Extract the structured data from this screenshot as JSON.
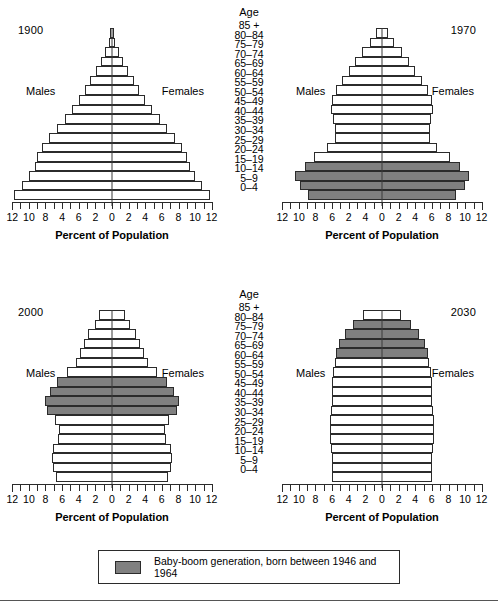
{
  "age_column": {
    "heading": "Age",
    "groups": [
      "85 +",
      "80–84",
      "75–79",
      "70–74",
      "65–69",
      "60–64",
      "55–59",
      "50–54",
      "45–49",
      "40–44",
      "35–39",
      "30–34",
      "25–29",
      "20–24",
      "15–19",
      "10–14",
      "5–9",
      "0–4"
    ]
  },
  "legend": {
    "label": "Baby-boom generation, born between 1946 and 1964",
    "swatch_color": "#808080"
  },
  "common": {
    "males_label": "Males",
    "females_label": "Females",
    "x_title": "Percent of Population",
    "bar_fill": "#ffffff",
    "bar_stroke": "#2b2b2b",
    "shaded_fill": "#808080"
  },
  "chart_data": {
    "type": "bar",
    "xlabel": "Percent of Population",
    "ylabel": "Age",
    "xlim": [
      -12,
      12
    ],
    "grid": false,
    "legend_position": "bottom",
    "categories": [
      "0–4",
      "5–9",
      "10–14",
      "15–19",
      "20–24",
      "25–29",
      "30–34",
      "35–39",
      "40–44",
      "45–49",
      "50–54",
      "55–59",
      "60–64",
      "65–69",
      "70–74",
      "75–79",
      "80–84",
      "85 +"
    ],
    "panels": [
      {
        "year": "1900",
        "tick_labels": [
          "12",
          "10",
          "8",
          "4",
          "6",
          "2",
          "0",
          "2",
          "4",
          "6",
          "8",
          "10",
          "12"
        ],
        "males": [
          11.8,
          10.8,
          10.0,
          9.3,
          9.0,
          8.4,
          7.6,
          6.6,
          5.7,
          4.8,
          4.0,
          3.2,
          2.6,
          1.9,
          1.3,
          0.8,
          0.4,
          0.2
        ],
        "females": [
          11.8,
          10.8,
          10.0,
          9.3,
          9.0,
          8.4,
          7.6,
          6.6,
          5.7,
          4.8,
          4.0,
          3.2,
          2.6,
          1.9,
          1.3,
          0.8,
          0.4,
          0.2
        ],
        "shaded": [
          false,
          false,
          false,
          false,
          false,
          false,
          false,
          false,
          false,
          false,
          false,
          false,
          false,
          false,
          false,
          false,
          false,
          false
        ]
      },
      {
        "year": "1970",
        "tick_labels": [
          "12",
          "10",
          "8",
          "6",
          "2",
          "4",
          "0",
          "2",
          "4",
          "6",
          "8",
          "10",
          "12"
        ],
        "males": [
          8.9,
          9.9,
          10.4,
          9.3,
          8.2,
          6.6,
          5.7,
          5.7,
          5.9,
          6.1,
          6.0,
          5.5,
          4.8,
          4.0,
          3.2,
          2.4,
          1.4,
          0.7
        ],
        "females": [
          8.9,
          9.9,
          10.4,
          9.3,
          8.2,
          6.6,
          5.7,
          5.7,
          5.9,
          6.1,
          6.0,
          5.5,
          4.8,
          4.0,
          3.2,
          2.4,
          1.4,
          0.7
        ],
        "shaded": [
          true,
          true,
          true,
          true,
          false,
          false,
          false,
          false,
          false,
          false,
          false,
          false,
          false,
          false,
          false,
          false,
          false,
          false
        ]
      },
      {
        "year": "2000",
        "tick_labels": [
          "12",
          "10",
          "8",
          "6",
          "4",
          "2",
          "0",
          "2",
          "4",
          "6",
          "8",
          "10",
          "12"
        ],
        "males": [
          6.9,
          7.2,
          7.4,
          7.2,
          6.6,
          6.5,
          6.9,
          7.9,
          8.1,
          7.5,
          6.6,
          5.4,
          4.3,
          3.7,
          3.2,
          2.6,
          1.8,
          1.2
        ],
        "females": [
          6.6,
          6.9,
          7.1,
          6.9,
          6.4,
          6.3,
          6.8,
          7.8,
          8.0,
          7.4,
          6.5,
          5.4,
          4.4,
          3.9,
          3.5,
          3.1,
          2.4,
          1.9
        ],
        "shaded": [
          false,
          false,
          false,
          false,
          false,
          false,
          false,
          true,
          true,
          true,
          true,
          false,
          false,
          false,
          false,
          false,
          false,
          false
        ]
      },
      {
        "year": "2030",
        "tick_labels": [
          "12",
          "10",
          "8",
          "6",
          "4",
          "2",
          "0",
          "2",
          "4",
          "6",
          "8",
          "10",
          "12"
        ],
        "males": [
          6.1,
          6.1,
          6.1,
          6.2,
          6.3,
          6.4,
          6.4,
          6.2,
          6.1,
          6.1,
          6.0,
          5.8,
          5.6,
          5.5,
          5.1,
          4.4,
          3.3,
          2.0
        ],
        "females": [
          5.9,
          5.9,
          5.9,
          6.0,
          6.1,
          6.2,
          6.2,
          6.1,
          6.0,
          6.0,
          6.0,
          5.9,
          5.7,
          5.6,
          5.3,
          4.6,
          3.6,
          2.6
        ],
        "shaded": [
          false,
          false,
          false,
          false,
          false,
          false,
          false,
          false,
          false,
          false,
          false,
          false,
          false,
          true,
          true,
          true,
          true,
          false
        ]
      }
    ]
  }
}
